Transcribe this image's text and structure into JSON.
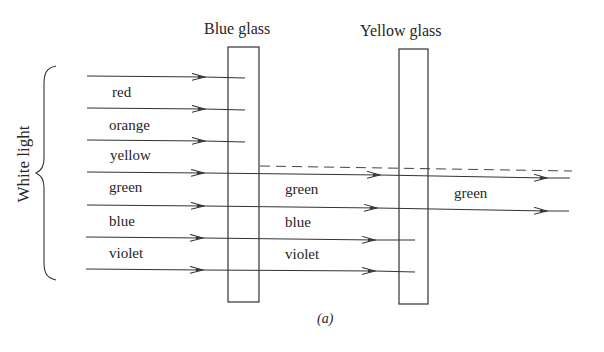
{
  "figure": {
    "caption": "(a)",
    "source_label": "White light",
    "filters": [
      {
        "name": "Blue glass",
        "x": 228,
        "y": 47,
        "w": 31,
        "h": 255
      },
      {
        "name": "Yellow glass",
        "x": 399,
        "y": 49,
        "w": 29,
        "h": 255
      }
    ],
    "incoming_labels": [
      "red",
      "orange",
      "yellow",
      "green",
      "blue",
      "violet"
    ],
    "after_blue_glass_labels": [
      "green",
      "blue",
      "violet"
    ],
    "after_yellow_glass_labels": [
      "green"
    ],
    "colors": {
      "line": "#333333",
      "text": "#262626",
      "background": "#ffffff"
    }
  },
  "labels": {
    "blue_glass": "Blue glass",
    "yellow_glass": "Yellow glass",
    "white_light": "White light",
    "in_red": "red",
    "in_orange": "orange",
    "in_yellow": "yellow",
    "in_green": "green",
    "in_blue": "blue",
    "in_violet": "violet",
    "mid_green": "green",
    "mid_blue": "blue",
    "mid_violet": "violet",
    "out_green": "green",
    "caption": "(a)"
  }
}
